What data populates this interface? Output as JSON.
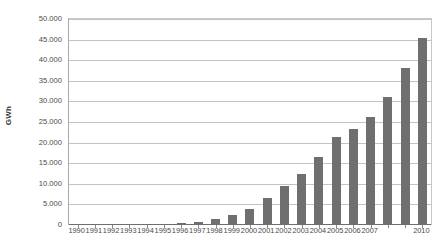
{
  "chart_data": {
    "type": "bar",
    "title": "",
    "subtitle": "",
    "xlabel": "",
    "ylabel": "GWh",
    "categories": [
      "1990",
      "1991",
      "1992",
      "1993",
      "1994",
      "1995",
      "1996",
      "1997",
      "1998",
      "1999",
      "2000",
      "2001",
      "2002",
      "2003",
      "2004",
      "2005",
      "2006",
      "2007",
      "2008",
      "2009",
      "2010"
    ],
    "visible_tick_labels": [
      "1990",
      "1991",
      "1992",
      "1993",
      "1994",
      "1995",
      "1996",
      "1997",
      "1998",
      "1999",
      "2000",
      "2001",
      "2002",
      "2003",
      "2004",
      "2005",
      "2006",
      "2007",
      "2010"
    ],
    "values": [
      40,
      60,
      90,
      130,
      190,
      280,
      420,
      800,
      1400,
      2400,
      4000,
      6500,
      9500,
      12300,
      16400,
      21300,
      23200,
      26100,
      31000,
      38000,
      45500
    ],
    "ylim": [
      0,
      50000
    ],
    "ytick_values": [
      0,
      5000,
      10000,
      15000,
      20000,
      25000,
      30000,
      35000,
      40000,
      45000,
      50000
    ],
    "ytick_labels": [
      "0",
      "5.000",
      "10.000",
      "15.000",
      "20.000",
      "25.000",
      "30.000",
      "35.000",
      "40.000",
      "45.000",
      "50.000"
    ],
    "grid": true,
    "grid_axis": "y",
    "legend": false,
    "legend_position": "none",
    "bar_color": "#706F6F",
    "gridline_color": "#C3C3C3",
    "axis_color": "#6E6E6E",
    "background_color": "#FFFFFF",
    "annotations": []
  }
}
